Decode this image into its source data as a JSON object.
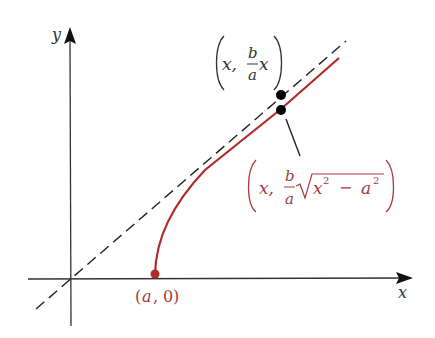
{
  "diagram": {
    "type": "hyperbola-asymptote",
    "axes": {
      "x_label": "x",
      "y_label": "y"
    },
    "curve": {
      "description": "upper branch y = (b/a)sqrt(x^2 - a^2)",
      "color": "#b22a2a"
    },
    "asymptote": {
      "description": "dashed line y = (b/a)x",
      "color": "#222222"
    },
    "labels": {
      "vertex": {
        "open": "(",
        "a": "a",
        "comma": ",",
        "zero": "0",
        "close": ")"
      },
      "asymptote_point": {
        "x": "x,",
        "b": "b",
        "a": "a",
        "x2": "x"
      },
      "curve_point": {
        "x": "x,",
        "b": "b",
        "a": "a",
        "x_var": "x",
        "exp1": "2",
        "minus": "−",
        "a_var": "a",
        "exp2": "2"
      }
    },
    "colors": {
      "red": "#b22a2a",
      "label_red": "#a8393b",
      "axis": "#333333",
      "black": "#000000"
    }
  }
}
